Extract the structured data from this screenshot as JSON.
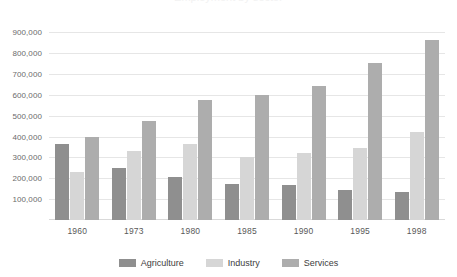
{
  "chart_data": {
    "type": "bar",
    "title": "",
    "xlabel": "",
    "ylabel": "",
    "ylim": [
      0,
      950000
    ],
    "grid": true,
    "legend_position": "bottom",
    "categories": [
      "1960",
      "1973",
      "1980",
      "1985",
      "1990",
      "1995",
      "1998"
    ],
    "ytick_labels": [
      "100,000",
      "200,000",
      "300,000",
      "400,000",
      "500,000",
      "600,000",
      "700,000",
      "800,000",
      "900,000"
    ],
    "ytick_values": [
      100000,
      200000,
      300000,
      400000,
      500000,
      600000,
      700000,
      800000,
      900000
    ],
    "series": [
      {
        "name": "Agriculture",
        "color": "#8f8f8f",
        "values": [
          365000,
          248000,
          207000,
          172000,
          170000,
          145000,
          135000
        ]
      },
      {
        "name": "Industry",
        "color": "#d6d6d6",
        "values": [
          232000,
          330000,
          365000,
          300000,
          320000,
          345000,
          420000
        ]
      },
      {
        "name": "Services",
        "color": "#adadad",
        "values": [
          400000,
          475000,
          575000,
          600000,
          645000,
          755000,
          865000
        ]
      }
    ]
  },
  "legend": {
    "items": [
      {
        "label": "Agriculture",
        "color": "#8f8f8f"
      },
      {
        "label": "Industry",
        "color": "#d6d6d6"
      },
      {
        "label": "Services",
        "color": "#adadad"
      }
    ]
  },
  "title_sliver": {
    "text": "Employment by sector"
  }
}
